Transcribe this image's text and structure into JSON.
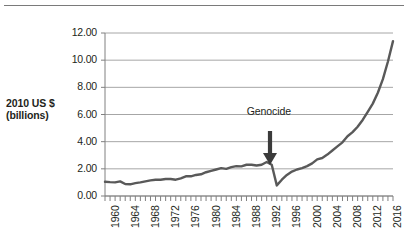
{
  "figure": {
    "name": "rwanda-gdp-line-chart",
    "top_rule_visible": true
  },
  "axis": {
    "y_title_line1": "2010 US $",
    "y_title_line2": "(billions)",
    "y_ticks": [
      "0.00",
      "2.00",
      "4.00",
      "6.00",
      "8.00",
      "10.00",
      "12.00"
    ],
    "x_ticks": [
      "1960",
      "1964",
      "1968",
      "1972",
      "1976",
      "1980",
      "1984",
      "1988",
      "1992",
      "1996",
      "2000",
      "2004",
      "2008",
      "2012",
      "2016"
    ]
  },
  "annotation": {
    "label": "Genocide",
    "arrow": "down-arrow"
  },
  "colors": {
    "line": "#595959",
    "gridline": "#a6a6a6",
    "axis": "#808080",
    "text": "#231f20",
    "background": "#ffffff"
  },
  "chart_data": {
    "type": "line",
    "title": "",
    "subtitle": "",
    "xlabel": "",
    "ylabel": "2010 US $ (billions)",
    "xlim": [
      1960,
      2017
    ],
    "ylim": [
      0.0,
      12.0
    ],
    "grid": true,
    "legend": false,
    "y_tick_values": [
      0.0,
      2.0,
      4.0,
      6.0,
      8.0,
      10.0,
      12.0
    ],
    "x_tick_values": [
      1960,
      1964,
      1968,
      1972,
      1976,
      1980,
      1984,
      1988,
      1992,
      1996,
      2000,
      2004,
      2008,
      2012,
      2016
    ],
    "annotations": [
      {
        "text": "Genocide",
        "x": 1994,
        "y": 6.2,
        "arrow_to_y": 3.6
      }
    ],
    "series": [
      {
        "name": "GDP",
        "x": [
          1960,
          1961,
          1962,
          1963,
          1964,
          1965,
          1966,
          1967,
          1968,
          1969,
          1970,
          1971,
          1972,
          1973,
          1974,
          1975,
          1976,
          1977,
          1978,
          1979,
          1980,
          1981,
          1982,
          1983,
          1984,
          1985,
          1986,
          1987,
          1988,
          1989,
          1990,
          1991,
          1992,
          1993,
          1994,
          1995,
          1996,
          1997,
          1998,
          1999,
          2000,
          2001,
          2002,
          2003,
          2004,
          2005,
          2006,
          2007,
          2008,
          2009,
          2010,
          2011,
          2012,
          2013,
          2014,
          2015,
          2016,
          2017
        ],
        "values": [
          1.05,
          1.02,
          1.0,
          1.08,
          0.88,
          0.86,
          0.95,
          1.0,
          1.08,
          1.15,
          1.2,
          1.2,
          1.25,
          1.25,
          1.2,
          1.3,
          1.45,
          1.45,
          1.55,
          1.6,
          1.75,
          1.85,
          1.95,
          2.05,
          2.0,
          2.12,
          2.2,
          2.18,
          2.3,
          2.3,
          2.25,
          2.3,
          2.5,
          2.3,
          0.78,
          1.2,
          1.55,
          1.8,
          1.95,
          2.05,
          2.2,
          2.4,
          2.7,
          2.8,
          3.05,
          3.35,
          3.65,
          3.95,
          4.4,
          4.7,
          5.1,
          5.6,
          6.2,
          6.8,
          7.6,
          8.6,
          9.9,
          11.4
        ]
      }
    ]
  }
}
